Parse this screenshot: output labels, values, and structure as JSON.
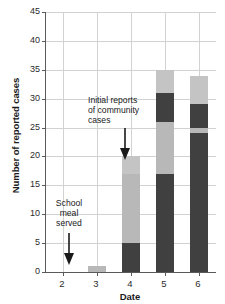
{
  "chart_data": {
    "type": "bar",
    "title": "",
    "subtitle": "",
    "xlabel": "Date",
    "ylabel": "Number of reported cases",
    "categories": [
      "2",
      "3",
      "4",
      "5",
      "6"
    ],
    "xlim": [
      1.5,
      6.5
    ],
    "ylim": [
      0,
      45
    ],
    "yticks": [
      0,
      5,
      10,
      15,
      20,
      25,
      30,
      35,
      40,
      45
    ],
    "grid": true,
    "legend": "none",
    "stacked": true,
    "series": [
      {
        "name": "segment-1-dark",
        "color": "#404040",
        "values": [
          0,
          0,
          5,
          17,
          24
        ]
      },
      {
        "name": "segment-2-light",
        "color": "#b8b8b8",
        "values": [
          0,
          1,
          12,
          9,
          1
        ]
      },
      {
        "name": "segment-3-dark",
        "color": "#404040",
        "values": [
          0,
          0,
          0,
          5,
          4
        ]
      },
      {
        "name": "segment-4-light",
        "color": "#b8b8b8",
        "values": [
          0,
          0,
          3,
          4,
          5
        ]
      }
    ],
    "totals": [
      0,
      1,
      20,
      35,
      34
    ],
    "bar_boundaries": [
      {
        "date": "2",
        "segments": []
      },
      {
        "date": "3",
        "segments": [
          {
            "from": 0,
            "to": 1,
            "color": "#b8b8b8"
          }
        ]
      },
      {
        "date": "4",
        "segments": [
          {
            "from": 0,
            "to": 5,
            "color": "#404040"
          },
          {
            "from": 5,
            "to": 17,
            "color": "#b8b8b8"
          },
          {
            "from": 17,
            "to": 20,
            "color": "#c4c4c4"
          }
        ]
      },
      {
        "date": "5",
        "segments": [
          {
            "from": 0,
            "to": 17,
            "color": "#404040"
          },
          {
            "from": 17,
            "to": 26,
            "color": "#b8b8b8"
          },
          {
            "from": 26,
            "to": 31,
            "color": "#404040"
          },
          {
            "from": 31,
            "to": 35,
            "color": "#c4c4c4"
          }
        ]
      },
      {
        "date": "6",
        "segments": [
          {
            "from": 0,
            "to": 24,
            "color": "#404040"
          },
          {
            "from": 24,
            "to": 25,
            "color": "#b8b8b8"
          },
          {
            "from": 25,
            "to": 29,
            "color": "#404040"
          },
          {
            "from": 29,
            "to": 34,
            "color": "#c4c4c4"
          }
        ]
      }
    ],
    "annotations": [
      {
        "id": "community",
        "text": "Initial reports\nof community\ncases",
        "points_to_date": "4",
        "arrow": "down"
      },
      {
        "id": "school",
        "text": "School\nmeal\nserved",
        "points_to_date": "2",
        "arrow": "down"
      }
    ]
  },
  "axis": {
    "y_title": "Number of reported cases",
    "x_title": "Date",
    "y_tick_labels": [
      "0",
      "5",
      "10",
      "15",
      "20",
      "25",
      "30",
      "35",
      "40",
      "45"
    ],
    "x_tick_labels": [
      "2",
      "3",
      "4",
      "5",
      "6"
    ]
  },
  "annotations": {
    "community": "Initial reports\nof community\ncases",
    "school": "School\nmeal\nserved"
  },
  "colors": {
    "dark_segment": "#404040",
    "light_segment": "#b8b8b8",
    "light_segment_top": "#c4c4c4",
    "gridline": "#d2d2d2",
    "axis": "#5a5a5a",
    "background": "#ffffff"
  }
}
